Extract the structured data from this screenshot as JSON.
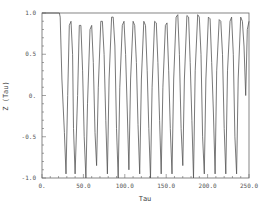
{
  "chart_data": {
    "type": "line",
    "title": "",
    "xlabel": "Tau",
    "ylabel": "Z (Tau)",
    "xlim": [
      0,
      250
    ],
    "ylim": [
      -1.0,
      1.0
    ],
    "grid": false,
    "legend": null,
    "x_ticks": [
      0,
      50,
      100,
      150,
      200,
      250
    ],
    "x_tick_labels": [
      "0.",
      "50.0",
      "100.0",
      "150.0",
      "200.0",
      "250.0"
    ],
    "y_ticks": [
      -1.0,
      -0.5,
      0,
      0.5,
      1.0
    ],
    "y_tick_labels": [
      "-1.0",
      "-0.5",
      "0.",
      "0.5",
      "1.0"
    ],
    "series": [
      {
        "name": "Z(Tau)",
        "color": "#555555",
        "x": [
          0,
          21,
          22,
          24,
          27,
          29,
          31,
          33,
          35,
          37,
          38,
          40,
          43,
          45,
          47,
          49,
          51,
          53,
          55,
          58,
          60,
          62,
          64,
          66,
          68,
          71,
          73,
          75,
          77,
          79,
          81,
          84,
          86,
          88,
          90,
          92,
          94,
          97,
          99,
          101,
          103,
          105,
          107,
          110,
          112,
          114,
          116,
          118,
          120,
          123,
          125,
          127,
          129,
          131,
          133,
          136,
          138,
          140,
          142,
          144,
          146,
          149,
          151,
          153,
          155,
          157,
          159,
          162,
          164,
          166,
          168,
          170,
          172,
          175,
          177,
          179,
          181,
          183,
          185,
          188,
          190,
          192,
          194,
          196,
          198,
          201,
          203,
          205,
          207,
          209,
          211,
          214,
          216,
          218,
          220,
          222,
          224,
          227,
          229,
          231,
          233,
          235,
          237,
          240,
          242,
          244,
          246,
          248,
          250
        ],
        "y": [
          1.0,
          1.0,
          0.95,
          0.2,
          -0.45,
          -0.95,
          0.0,
          0.85,
          0.9,
          0.5,
          -0.4,
          -0.95,
          0.0,
          0.85,
          0.85,
          0.3,
          -0.5,
          -1.0,
          -0.1,
          0.8,
          0.85,
          0.4,
          -0.45,
          -0.85,
          0.1,
          0.9,
          0.9,
          0.5,
          -0.3,
          -0.95,
          0.2,
          0.95,
          0.95,
          0.6,
          -0.4,
          -1.0,
          0.1,
          0.85,
          0.9,
          0.5,
          -0.2,
          -0.9,
          0.2,
          0.9,
          0.85,
          0.4,
          -0.35,
          -0.95,
          0.2,
          0.9,
          0.85,
          0.3,
          -0.4,
          -1.0,
          0.1,
          0.9,
          0.88,
          0.4,
          -0.3,
          -0.95,
          0.1,
          0.85,
          0.88,
          0.3,
          -0.4,
          -0.95,
          0.2,
          0.95,
          0.98,
          0.5,
          -0.4,
          -0.85,
          0.2,
          0.97,
          0.95,
          0.4,
          -0.3,
          -1.0,
          0.3,
          0.98,
          0.95,
          0.5,
          -0.5,
          -0.95,
          0.2,
          0.95,
          0.93,
          0.4,
          -0.2,
          -0.95,
          0.3,
          0.92,
          0.9,
          0.5,
          -0.4,
          -0.95,
          0.3,
          0.9,
          0.95,
          0.5,
          -0.5,
          -0.95,
          0.2,
          0.95,
          0.9,
          0.6,
          0.0,
          0.8,
          0.9
        ]
      }
    ]
  },
  "axes": {
    "xlabel": "Tau",
    "ylabel": "Z (Tau)"
  }
}
